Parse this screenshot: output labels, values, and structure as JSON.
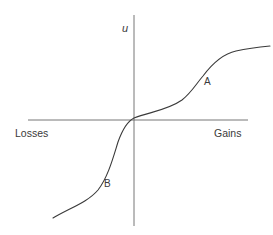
{
  "diagram": {
    "type": "value-function",
    "axes": {
      "y_label": "u",
      "x_left_label": "Losses",
      "x_right_label": "Gains"
    },
    "points": [
      {
        "label": "A",
        "region": "gains, concave"
      },
      {
        "label": "B",
        "region": "losses, convex"
      }
    ],
    "colors": {
      "line": "#3a3a3a",
      "axis": "#555555",
      "background": "#ffffff"
    }
  }
}
